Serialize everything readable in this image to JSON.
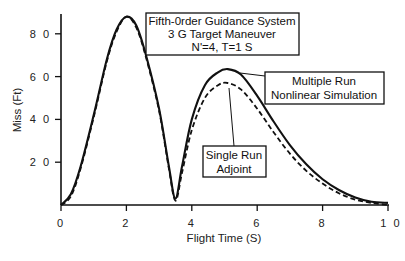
{
  "chart_data": {
    "type": "line",
    "subtitle": [
      "3 G Target Maneuver",
      "N'=4, T=1 S"
    ],
    "xlabel": "Flight Time (S)",
    "ylabel": "Miss (Ft)",
    "xlim": [
      0,
      10
    ],
    "ylim": [
      0,
      90
    ],
    "x_ticks": [
      0,
      2,
      4,
      6,
      8,
      10
    ],
    "x_tick_labels": [
      "0",
      "2",
      "4",
      "6",
      "8",
      "1 0"
    ],
    "y_ticks": [
      20,
      40,
      60,
      80
    ],
    "y_tick_labels": [
      "2 0",
      "4 0",
      "6 0",
      "8 0"
    ],
    "grid": false,
    "legend_position": "annotation boxes",
    "series": [
      {
        "name": "Multiple Run Nonlinear Simulation",
        "style": "solid",
        "x": [
          0,
          0.3,
          0.6,
          1.0,
          1.4,
          1.7,
          2.0,
          2.3,
          2.6,
          3.0,
          3.3,
          3.5,
          3.7,
          4.0,
          4.4,
          4.8,
          5.1,
          5.5,
          6.0,
          6.5,
          7.0,
          7.5,
          8.0,
          8.5,
          9.0,
          9.5,
          10.0
        ],
        "y": [
          0,
          5,
          18,
          42,
          68,
          82,
          88,
          84,
          70,
          45,
          18,
          3,
          18,
          40,
          56,
          62,
          63.5,
          61,
          51,
          39,
          28,
          19,
          12,
          7,
          3.5,
          1.5,
          1
        ]
      },
      {
        "name": "Single Run Adjoint",
        "style": "dashed",
        "x": [
          0,
          0.3,
          0.6,
          1.0,
          1.4,
          1.7,
          2.0,
          2.3,
          2.6,
          3.0,
          3.3,
          3.5,
          3.7,
          4.0,
          4.4,
          4.8,
          5.1,
          5.5,
          6.0,
          6.5,
          7.0,
          7.5,
          8.0,
          8.5,
          9.0,
          9.5,
          10.0
        ],
        "y": [
          0,
          4,
          17,
          41,
          67,
          81,
          88,
          83,
          69,
          44,
          17,
          2,
          15,
          35,
          50,
          56,
          57,
          54,
          45,
          34,
          24,
          16,
          10,
          5.5,
          2.5,
          1,
          0
        ]
      }
    ],
    "annotations": [
      {
        "text": [
          "Fifth-0rder Guidance System",
          "3 G Target Maneuver",
          "N'=4, T=1 S"
        ],
        "type": "title-box"
      },
      {
        "text": [
          "Multiple Run",
          "Nonlinear Simulation"
        ],
        "points_to": "solid curve peak"
      },
      {
        "text": [
          "Single Run",
          "Adjoint"
        ],
        "points_to": "dashed curve peak"
      }
    ]
  },
  "labels": {
    "title_box": [
      "Fifth-0rder Guidance System",
      "3 G Target Maneuver",
      "N'=4, T=1 S"
    ],
    "multiple_run": [
      "Multiple Run",
      "Nonlinear Simulation"
    ],
    "single_run": [
      "Single Run",
      "Adjoint"
    ],
    "xlabel": "Flight Time (S)",
    "ylabel": "Miss (Ft)",
    "x_ticks": [
      "0",
      "2",
      "4",
      "6",
      "8",
      "1 0"
    ],
    "y_ticks": [
      "8 0",
      "6 0",
      "4 0",
      "2 0"
    ]
  }
}
